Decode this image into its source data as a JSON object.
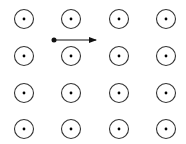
{
  "diagram": {
    "field": {
      "direction": "out-of-page",
      "symbol": "dot-in-circle",
      "rows": 4,
      "cols": 4,
      "x_positions": [
        24,
        71,
        119,
        166
      ],
      "y_positions": [
        19,
        56,
        93,
        129
      ],
      "radius": 9.5,
      "color": "#333333"
    },
    "particle": {
      "x": 54,
      "y": 40,
      "velocity_direction": "right",
      "arrow_end_x": 96,
      "color": "#111111"
    }
  }
}
